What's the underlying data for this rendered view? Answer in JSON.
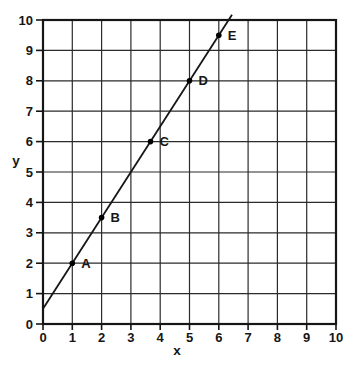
{
  "chart_data": {
    "type": "line",
    "title": "",
    "xlabel": "x",
    "ylabel": "y",
    "xlim": [
      0,
      10
    ],
    "ylim": [
      0,
      10
    ],
    "xticks": [
      0,
      1,
      2,
      3,
      4,
      5,
      6,
      7,
      8,
      9,
      10
    ],
    "yticks": [
      0,
      1,
      2,
      3,
      4,
      5,
      6,
      7,
      8,
      9,
      10
    ],
    "grid": true,
    "legend": false,
    "line": {
      "slope": 1.5,
      "intercept": 0.5,
      "x_draw_start": 0,
      "x_draw_end": 6.45
    },
    "points": [
      {
        "label": "A",
        "x": 1,
        "y": 2
      },
      {
        "label": "B",
        "x": 2,
        "y": 3.5
      },
      {
        "label": "C",
        "x": 3.67,
        "y": 6
      },
      {
        "label": "D",
        "x": 5,
        "y": 8
      },
      {
        "label": "E",
        "x": 6,
        "y": 9.5
      }
    ],
    "colors": {
      "background": "#ffffff",
      "grid": "#2b2b2b",
      "axis": "#161616",
      "line": "#161616",
      "point": "#000000",
      "text": "#161616"
    }
  }
}
